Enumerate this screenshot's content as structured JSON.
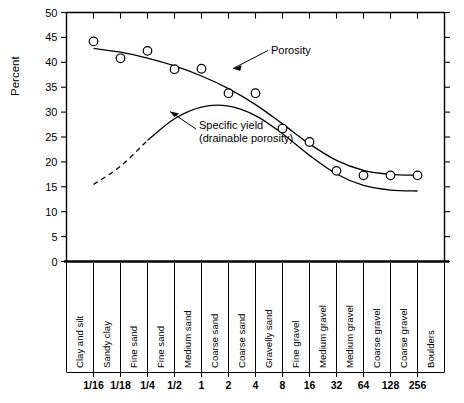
{
  "chart_data": {
    "type": "line",
    "title": "",
    "subtitle": "",
    "xlabel": "",
    "ylabel": "Percent",
    "ylim": [
      0,
      50
    ],
    "ytick_labels": [
      "0",
      "5",
      "10",
      "15",
      "20",
      "25",
      "30",
      "35",
      "40",
      "45",
      "50"
    ],
    "ytick_values": [
      0,
      5,
      10,
      15,
      20,
      25,
      30,
      35,
      40,
      45,
      50
    ],
    "grid": false,
    "legend_position": "inline-annotations",
    "xtick_labels": [
      "1/16",
      "1/18",
      "1/4",
      "1/2",
      "1",
      "2",
      "4",
      "8",
      "16",
      "32",
      "64",
      "128",
      "256"
    ],
    "x_categories": [
      "Clay and silt",
      "Sandy clay",
      "Fine sand",
      "Fine sand",
      "Medium sand",
      "Coarse sand",
      "Coarse sand",
      "Gravelly sand",
      "Fine gravel",
      "Medium gravel",
      "Medium gravel",
      "Coarse gravel",
      "Coarse gravel",
      "Boulders"
    ],
    "annotations": [
      {
        "text": "Porosity",
        "line2": ""
      },
      {
        "text": "Specific yield",
        "line2": "(drainable porosity)"
      }
    ],
    "series": [
      {
        "name": "Porosity",
        "style": "solid-with-markers",
        "x": [
          "1/16",
          "1/18",
          "1/4",
          "1/2",
          "1",
          "2",
          "4",
          "8",
          "16",
          "32",
          "64",
          "128",
          "256"
        ],
        "values": [
          44.2,
          40.8,
          42.3,
          38.6,
          38.7,
          33.8,
          33.8,
          26.7,
          24.0,
          18.2,
          17.3,
          17.3,
          17.3
        ],
        "marker_points": [
          {
            "x": "1/16",
            "y": 44.2
          },
          {
            "x": "1/18",
            "y": 40.8
          },
          {
            "x": "1/4",
            "y": 42.3
          },
          {
            "x": "1/2",
            "y": 38.6
          },
          {
            "x": "1",
            "y": 38.7
          },
          {
            "x": "2",
            "y": 33.8
          },
          {
            "x": "4",
            "y": 33.8
          },
          {
            "x": "8",
            "y": 26.7
          },
          {
            "x": "16",
            "y": 24.0
          },
          {
            "x": "32",
            "y": 18.2
          },
          {
            "x": "64",
            "y": 17.3
          },
          {
            "x": "128",
            "y": 17.3
          },
          {
            "x": "256",
            "y": 17.3
          }
        ]
      },
      {
        "name": "Specific yield (drainable porosity)",
        "style": "solid-with-dashed-extension",
        "x": [
          "1/16",
          "1/18",
          "1/4",
          "1/2",
          "1",
          "2",
          "4",
          "8",
          "16",
          "32",
          "64",
          "128",
          "256"
        ],
        "values": [
          13.0,
          18.5,
          25.0,
          30.0,
          32.0,
          32.2,
          30.5,
          26.0,
          21.0,
          16.5,
          14.5,
          14.0,
          14.2
        ],
        "dashed_segment_x_range": [
          "1/16",
          "1/4"
        ]
      }
    ]
  },
  "axes": {
    "y_title": "Percent"
  }
}
